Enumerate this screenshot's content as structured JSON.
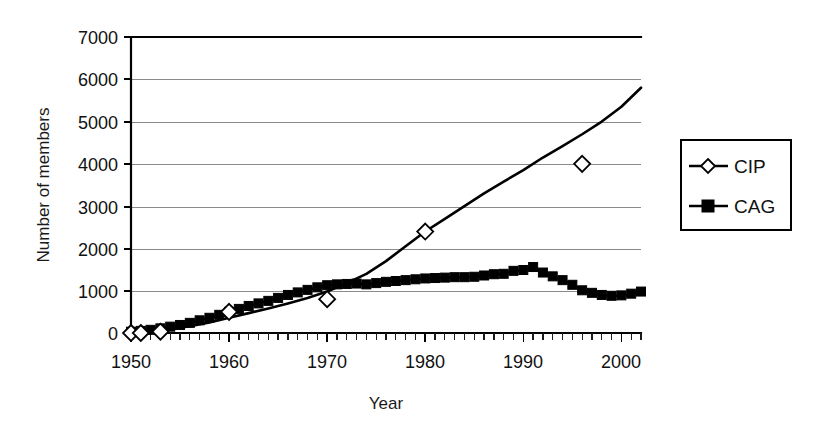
{
  "chart_data": {
    "type": "line",
    "title": "",
    "xlabel": "Year",
    "ylabel": "Number of members",
    "xlim": [
      1950,
      2002
    ],
    "ylim": [
      0,
      7000
    ],
    "grid": true,
    "legend_position": "right-outside",
    "x_ticks": [
      1950,
      1960,
      1970,
      1980,
      1990,
      2000
    ],
    "x_tick_labels": [
      "1950",
      "1960",
      "1970",
      "1980",
      "1990",
      "2000"
    ],
    "x_minor_tick_step": 1,
    "y_ticks": [
      0,
      1000,
      2000,
      3000,
      4000,
      5000,
      6000,
      7000
    ],
    "y_tick_labels": [
      "0",
      "1000",
      "2000",
      "3000",
      "4000",
      "5000",
      "6000",
      "7000"
    ],
    "series": [
      {
        "name": "CIP",
        "marker": "open-diamond",
        "color": "#000000",
        "marker_points": [
          {
            "x": 1950,
            "y": 0
          },
          {
            "x": 1951,
            "y": 0
          },
          {
            "x": 1953,
            "y": 30
          },
          {
            "x": 1960,
            "y": 500
          },
          {
            "x": 1970,
            "y": 800
          },
          {
            "x": 1980,
            "y": 2400
          },
          {
            "x": 1996,
            "y": 4000
          }
        ],
        "x": [
          1950,
          1952,
          1954,
          1956,
          1958,
          1960,
          1962,
          1964,
          1966,
          1968,
          1970,
          1972,
          1974,
          1976,
          1978,
          1980,
          1982,
          1984,
          1986,
          1988,
          1990,
          1992,
          1994,
          1996,
          1998,
          2000,
          2002
        ],
        "values": [
          10,
          40,
          90,
          160,
          250,
          360,
          470,
          580,
          700,
          830,
          980,
          1180,
          1400,
          1700,
          2050,
          2400,
          2700,
          3000,
          3300,
          3580,
          3850,
          4150,
          4420,
          4700,
          5000,
          5350,
          5800
        ]
      },
      {
        "name": "CAG",
        "marker": "filled-square",
        "color": "#000000",
        "x": [
          1950,
          1951,
          1952,
          1953,
          1954,
          1955,
          1956,
          1957,
          1958,
          1959,
          1960,
          1961,
          1962,
          1963,
          1964,
          1965,
          1966,
          1967,
          1968,
          1969,
          1970,
          1971,
          1972,
          1973,
          1974,
          1975,
          1976,
          1977,
          1978,
          1979,
          1980,
          1981,
          1982,
          1983,
          1984,
          1985,
          1986,
          1987,
          1988,
          1989,
          1990,
          1991,
          1992,
          1993,
          1994,
          1995,
          1996,
          1997,
          1998,
          1999,
          2000,
          2001,
          2002
        ],
        "values": [
          30,
          50,
          75,
          110,
          150,
          190,
          240,
          300,
          360,
          430,
          500,
          570,
          640,
          700,
          760,
          830,
          900,
          960,
          1020,
          1080,
          1130,
          1150,
          1160,
          1170,
          1150,
          1180,
          1210,
          1230,
          1250,
          1270,
          1290,
          1300,
          1310,
          1320,
          1320,
          1330,
          1360,
          1390,
          1400,
          1470,
          1490,
          1560,
          1430,
          1340,
          1250,
          1140,
          1010,
          950,
          900,
          880,
          890,
          930,
          980
        ]
      }
    ]
  },
  "legend": {
    "entries": [
      {
        "label": "CIP",
        "marker": "open-diamond"
      },
      {
        "label": "CAG",
        "marker": "filled-square"
      }
    ]
  },
  "axes": {
    "y_title": "Number of members",
    "x_title": "Year"
  }
}
